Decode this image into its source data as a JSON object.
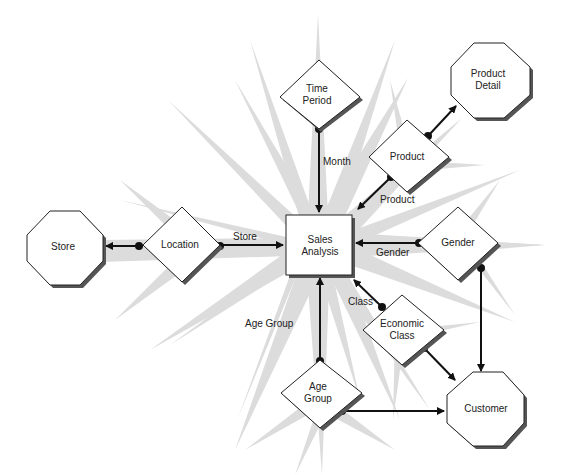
{
  "diagram": {
    "type": "star-schema",
    "colors": {
      "starburst": "#dcdcdc",
      "line": "#111111",
      "node_fill": "#ffffff",
      "shadow": "#555555"
    },
    "fact": {
      "id": "sales",
      "shape": "rectangle",
      "label_line1": "Sales",
      "label_line2": "Analysis"
    },
    "dimensions": [
      {
        "id": "time",
        "shape": "diamond",
        "label_line1": "Time",
        "label_line2": "Period"
      },
      {
        "id": "product",
        "shape": "diamond",
        "label_line1": "Product",
        "label_line2": ""
      },
      {
        "id": "gender",
        "shape": "diamond",
        "label_line1": "Gender",
        "label_line2": ""
      },
      {
        "id": "location",
        "shape": "diamond",
        "label_line1": "Location",
        "label_line2": ""
      },
      {
        "id": "economic",
        "shape": "diamond",
        "label_line1": "Economic",
        "label_line2": "Class"
      },
      {
        "id": "agegroup",
        "shape": "diamond",
        "label_line1": "Age",
        "label_line2": "Group"
      }
    ],
    "entities": [
      {
        "id": "productdetail",
        "shape": "octagon",
        "label_line1": "Product",
        "label_line2": "Detail"
      },
      {
        "id": "store",
        "shape": "octagon",
        "label_line1": "Store",
        "label_line2": ""
      },
      {
        "id": "customer",
        "shape": "octagon",
        "label_line1": "Customer",
        "label_line2": ""
      }
    ],
    "edge_labels": {
      "month": "Month",
      "product": "Product",
      "store": "Store",
      "gender": "Gender",
      "class": "Class",
      "agegroup": "Age Group"
    },
    "edges": [
      {
        "from": "time",
        "to": "sales",
        "label": "Month"
      },
      {
        "from": "product",
        "to": "sales",
        "label": "Product"
      },
      {
        "from": "product",
        "to": "productdetail",
        "label": ""
      },
      {
        "from": "location",
        "to": "sales",
        "label": "Store"
      },
      {
        "from": "location",
        "to": "store",
        "label": ""
      },
      {
        "from": "gender",
        "to": "sales",
        "label": "Gender"
      },
      {
        "from": "gender",
        "to": "customer",
        "label": ""
      },
      {
        "from": "economic",
        "to": "sales",
        "label": "Class"
      },
      {
        "from": "economic",
        "to": "customer",
        "label": ""
      },
      {
        "from": "agegroup",
        "to": "sales",
        "label": "Age Group"
      },
      {
        "from": "agegroup",
        "to": "customer",
        "label": ""
      }
    ]
  }
}
